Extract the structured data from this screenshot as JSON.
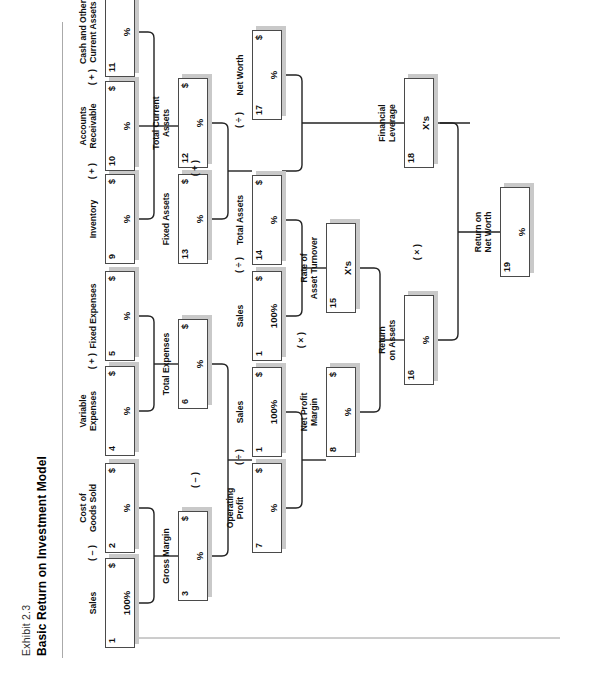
{
  "exhibit": {
    "label": "Exhibit 2.3",
    "title": "Basic Return on Investment Model"
  },
  "units": {
    "dollar": "$",
    "percent": "%",
    "times": "X's"
  },
  "operators": {
    "minus": "( – )",
    "plus": "( + )",
    "divide": "( ÷ )",
    "multiply": "( × )"
  },
  "nodes": [
    {
      "id": 1,
      "num": "1",
      "caption": "Sales",
      "unit": "$",
      "value": "100%"
    },
    {
      "id": 2,
      "num": "2",
      "caption": "Cost of\nGoods Sold",
      "unit": "$",
      "value": "%"
    },
    {
      "id": 3,
      "num": "3",
      "caption": "Gross Margin",
      "unit": "$",
      "value": "%"
    },
    {
      "id": 4,
      "num": "4",
      "caption": "Variable\nExpenses",
      "unit": "$",
      "value": "%"
    },
    {
      "id": 5,
      "num": "5",
      "caption": "Fixed Expenses",
      "unit": "$",
      "value": "%"
    },
    {
      "id": 6,
      "num": "6",
      "caption": "Total Expenses",
      "unit": "$",
      "value": "%"
    },
    {
      "id": 7,
      "num": "7",
      "caption": "Operating\nProfit",
      "unit": "$",
      "value": "%"
    },
    {
      "id": 8,
      "num": "1",
      "caption": "Sales",
      "unit": "$",
      "value": "100%"
    },
    {
      "id": 9,
      "num": "8",
      "caption": "Net Profit\nMargin",
      "unit": "$",
      "value": "%"
    },
    {
      "id": 10,
      "num": "9",
      "caption": "Inventory",
      "unit": "$",
      "value": "%"
    },
    {
      "id": 11,
      "num": "10",
      "caption": "Accounts\nReceivable",
      "unit": "$",
      "value": "%"
    },
    {
      "id": 12,
      "num": "11",
      "caption": "Cash and Other\nCurrent Assets",
      "unit": "$",
      "value": "%"
    },
    {
      "id": 13,
      "num": "12",
      "caption": "Total Current\nAssets",
      "unit": "$",
      "value": "%"
    },
    {
      "id": 14,
      "num": "13",
      "caption": "Fixed Assets",
      "unit": "$",
      "value": "%"
    },
    {
      "id": 15,
      "num": "1",
      "caption": "Sales",
      "unit": "$",
      "value": "100%"
    },
    {
      "id": 16,
      "num": "14",
      "caption": "Total Assets",
      "unit": "$",
      "value": "%"
    },
    {
      "id": 17,
      "num": "15",
      "caption": "Rate of\nAsset Turnover",
      "unit": "",
      "value": "X's"
    },
    {
      "id": 18,
      "num": "17",
      "caption": "Net Worth",
      "unit": "$",
      "value": "%"
    },
    {
      "id": 19,
      "num": "16",
      "caption": "Return\non Assets",
      "unit": "",
      "value": "%"
    },
    {
      "id": 20,
      "num": "18",
      "caption": "Financial\nLeverage",
      "unit": "",
      "value": "X's"
    },
    {
      "id": 21,
      "num": "19",
      "caption": "Return on\nNet Worth",
      "unit": "",
      "value": "%"
    }
  ],
  "operator_marks": [
    {
      "key": "m1",
      "symbol": "( – )"
    },
    {
      "key": "m2",
      "symbol": "( + )"
    },
    {
      "key": "m3",
      "symbol": "( – )"
    },
    {
      "key": "m4",
      "symbol": "( ÷ )"
    },
    {
      "key": "m5",
      "symbol": "( + )"
    },
    {
      "key": "m6",
      "symbol": "( + )"
    },
    {
      "key": "m7",
      "symbol": "( + )"
    },
    {
      "key": "m8",
      "symbol": "( ÷ )"
    },
    {
      "key": "m9",
      "symbol": "( × )"
    },
    {
      "key": "m10",
      "symbol": "( ÷ )"
    },
    {
      "key": "m11",
      "symbol": "( × )"
    }
  ],
  "colors": {
    "box_border": "#4a4a4a",
    "box_fill": "#ffffff",
    "shadow": "#c9c9c9",
    "wire": "#222222",
    "rule": "#aaaaaa"
  }
}
